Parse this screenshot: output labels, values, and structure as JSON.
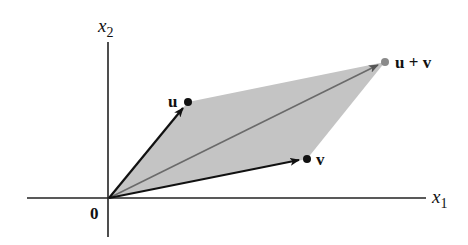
{
  "diagram": {
    "axes": {
      "x_label": "x",
      "x_sub": "1",
      "y_label": "x",
      "y_sub": "2",
      "origin_label": "0"
    },
    "vectors": [
      {
        "name": "u",
        "label": "u",
        "tip": [
          188,
          102
        ]
      },
      {
        "name": "v",
        "label": "v",
        "tip": [
          307,
          159
        ]
      },
      {
        "name": "u+v",
        "label": "u + v",
        "tip": [
          385,
          62
        ]
      }
    ],
    "origin": [
      109,
      198
    ],
    "colors": {
      "fill": "#c4c4c4",
      "axis": "#222222",
      "vector": "#111111",
      "sum_vector": "#6e6e6e",
      "sum_point": "#8a8a8a"
    }
  }
}
